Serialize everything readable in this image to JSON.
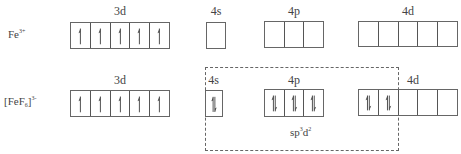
{
  "rows": [
    {
      "species": {
        "base": "Fe",
        "sup": "3+",
        "sub": ""
      },
      "orbitals": [
        {
          "label": "3d",
          "cells": [
            "up",
            "up",
            "up",
            "up",
            "up"
          ]
        },
        {
          "label": "4s",
          "cells": [
            "empty"
          ]
        },
        {
          "label": "4p",
          "cells": [
            "empty",
            "empty",
            "empty"
          ]
        },
        {
          "label": "4d",
          "cells": [
            "empty",
            "empty",
            "empty",
            "empty",
            "empty"
          ]
        }
      ]
    },
    {
      "species": {
        "open": "[",
        "base": "FeF",
        "sub": "6",
        "close": "]",
        "sup": "3-"
      },
      "orbitals": [
        {
          "label": "3d",
          "cells": [
            "up",
            "up",
            "up",
            "up",
            "up"
          ]
        },
        {
          "label": "4s",
          "cells": [
            "pair"
          ]
        },
        {
          "label": "4p",
          "cells": [
            "pair",
            "pair",
            "pair"
          ]
        },
        {
          "label": "4d",
          "cells": [
            "pair",
            "pair",
            "empty",
            "empty",
            "empty"
          ]
        }
      ],
      "hybridization": {
        "base": "sp",
        "sup1": "3",
        "mid": "d",
        "sup2": "2"
      }
    }
  ],
  "colors": {
    "line": "#555555",
    "text": "#444444",
    "background": "#ffffff"
  }
}
